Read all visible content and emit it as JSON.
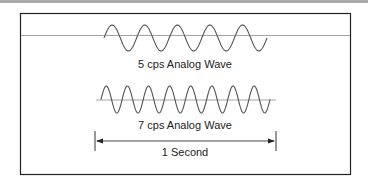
{
  "figure": {
    "wave_5cps": {
      "label": "5 cps Analog Wave",
      "cycles": 5
    },
    "wave_7cps": {
      "label": "7 cps Analog Wave",
      "cycles": 8
    },
    "duration": {
      "label": "1 Second"
    }
  },
  "colors": {
    "frame": "#222222",
    "wave": "#555555",
    "baseline": "#999999",
    "top_strip": "#a8a8a8"
  }
}
